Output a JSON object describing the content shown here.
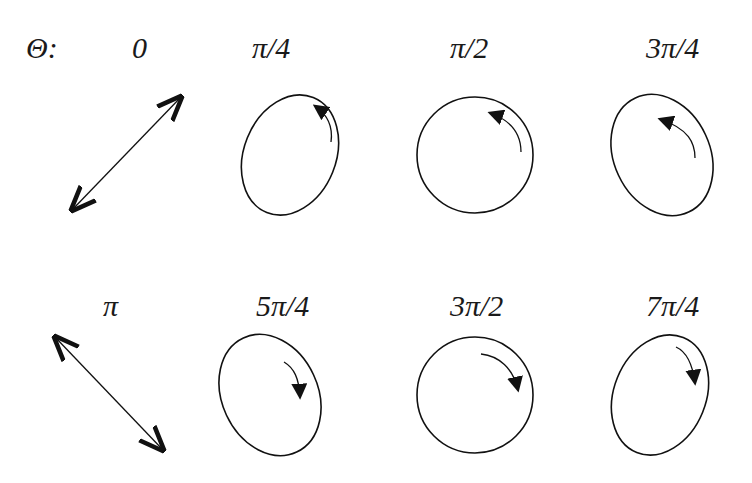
{
  "diagram": {
    "variable_label": "Θ:",
    "phases": [
      {
        "label": "0",
        "shape": "linear",
        "orientation": "+45deg",
        "rotation": "none"
      },
      {
        "label": "π/4",
        "shape": "ellipse",
        "orientation": "tilted-right",
        "rotation": "counterclockwise"
      },
      {
        "label": "π/2",
        "shape": "circle",
        "orientation": "none",
        "rotation": "counterclockwise"
      },
      {
        "label": "3π/4",
        "shape": "ellipse",
        "orientation": "tilted-left",
        "rotation": "counterclockwise"
      },
      {
        "label": "π",
        "shape": "linear",
        "orientation": "-45deg",
        "rotation": "none"
      },
      {
        "label": "5π/4",
        "shape": "ellipse",
        "orientation": "tilted-left",
        "rotation": "clockwise"
      },
      {
        "label": "3π/2",
        "shape": "circle",
        "orientation": "none",
        "rotation": "clockwise"
      },
      {
        "label": "7π/4",
        "shape": "ellipse",
        "orientation": "tilted-right",
        "rotation": "clockwise"
      }
    ]
  }
}
